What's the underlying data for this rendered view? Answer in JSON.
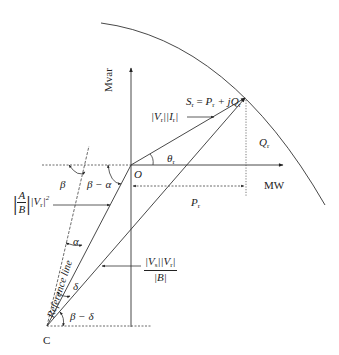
{
  "diagram": {
    "axes": {
      "vertical_label": "Mvar",
      "horizontal_label": "MW",
      "origin_label": "O"
    },
    "points": {
      "center_label": "C"
    },
    "labels": {
      "apparent_power": "S",
      "apparent_power_sub": "r",
      "apparent_power_eq": " = ",
      "p_part": "P",
      "p_sub": "r",
      "plus_j": " + j",
      "q_part": "Q",
      "q_sub": "r",
      "vi_product_v": "|V",
      "vi_product_v_sub": "r",
      "vi_product_i": "||I",
      "vi_product_i_sub": "r",
      "vi_product_close": "|",
      "q_r": "Q",
      "q_r_sub": "r",
      "p_r": "P",
      "p_r_sub": "r",
      "theta": "θ",
      "theta_sub": "r",
      "beta": "β",
      "beta_minus_alpha": "β − α",
      "alpha": "α",
      "delta": "δ",
      "beta_minus_delta": "β − δ",
      "ab_num": "A",
      "ab_den": "B",
      "ab_vr": "|V",
      "ab_vr_sub": "r",
      "ab_vr_close": "|",
      "ab_sq": "2",
      "vs_vr_num_vs": "|V",
      "vs_vr_num_vs_sub": "s",
      "vs_vr_num_vr": "||V",
      "vs_vr_num_vr_sub": "r",
      "vs_vr_num_close": "|",
      "vs_vr_den": "|B|",
      "reference_line": "Reference line"
    },
    "colors": {
      "line": "#333333",
      "text": "#222222"
    }
  }
}
